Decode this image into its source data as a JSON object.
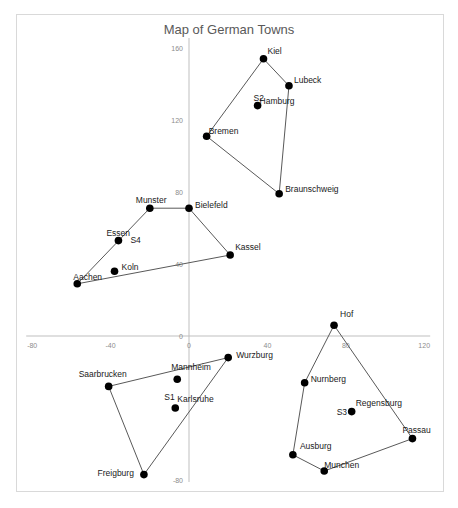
{
  "chart_data": {
    "type": "scatter",
    "title": "Map of German Towns",
    "xlabel": "",
    "ylabel": "",
    "xlim": [
      -80,
      120
    ],
    "ylim": [
      -80,
      160
    ],
    "x_ticks": [
      -80,
      -40,
      0,
      40,
      80,
      120
    ],
    "y_ticks": [
      -80,
      0,
      40,
      80,
      120,
      160
    ],
    "grid": false,
    "legend": null,
    "points": [
      {
        "name": "Kiel",
        "x": 38,
        "y": 154
      },
      {
        "name": "Lubeck",
        "x": 51,
        "y": 139
      },
      {
        "name": "Hamburg",
        "x": 35,
        "y": 128,
        "annotation": "S2"
      },
      {
        "name": "Bremen",
        "x": 9,
        "y": 111
      },
      {
        "name": "Braunschweig",
        "x": 46,
        "y": 79
      },
      {
        "name": "Bielefeld",
        "x": 0,
        "y": 71
      },
      {
        "name": "Munster",
        "x": -20,
        "y": 71
      },
      {
        "name": "Essen",
        "x": -36,
        "y": 53,
        "annotation": "S4"
      },
      {
        "name": "Kassel",
        "x": 21,
        "y": 45
      },
      {
        "name": "Koln",
        "x": -38,
        "y": 36
      },
      {
        "name": "Aachen",
        "x": -57,
        "y": 29
      },
      {
        "name": "Hof",
        "x": 74,
        "y": 6
      },
      {
        "name": "Wurzburg",
        "x": 20,
        "y": -12
      },
      {
        "name": "Mannheim",
        "x": -6,
        "y": -24
      },
      {
        "name": "Karlsruhe",
        "x": -7,
        "y": -40,
        "annotation": "S1"
      },
      {
        "name": "Saarbrucken",
        "x": -41,
        "y": -28
      },
      {
        "name": "Freigburg",
        "x": -23,
        "y": -77
      },
      {
        "name": "Nurnberg",
        "x": 59,
        "y": -26
      },
      {
        "name": "Regensburg",
        "x": 83,
        "y": -42,
        "annotation": "S3"
      },
      {
        "name": "Passau",
        "x": 114,
        "y": -57
      },
      {
        "name": "Ausburg",
        "x": 53,
        "y": -66
      },
      {
        "name": "Munchen",
        "x": 69,
        "y": -75
      }
    ],
    "hulls": [
      {
        "name": "North",
        "vertices": [
          "Kiel",
          "Lubeck",
          "Braunschweig",
          "Bremen",
          "Kiel"
        ]
      },
      {
        "name": "West",
        "vertices": [
          "Aachen",
          "Munster",
          "Bielefeld",
          "Kassel",
          "Aachen"
        ]
      },
      {
        "name": "Southwest",
        "vertices": [
          "Saarbrucken",
          "Wurzburg",
          "Freigburg",
          "Saarbrucken"
        ]
      },
      {
        "name": "Southeast",
        "vertices": [
          "Hof",
          "Passau",
          "Munchen",
          "Ausburg",
          "Nurnberg",
          "Hof"
        ]
      }
    ],
    "annotations": [
      "S1",
      "S2",
      "S3",
      "S4"
    ]
  }
}
